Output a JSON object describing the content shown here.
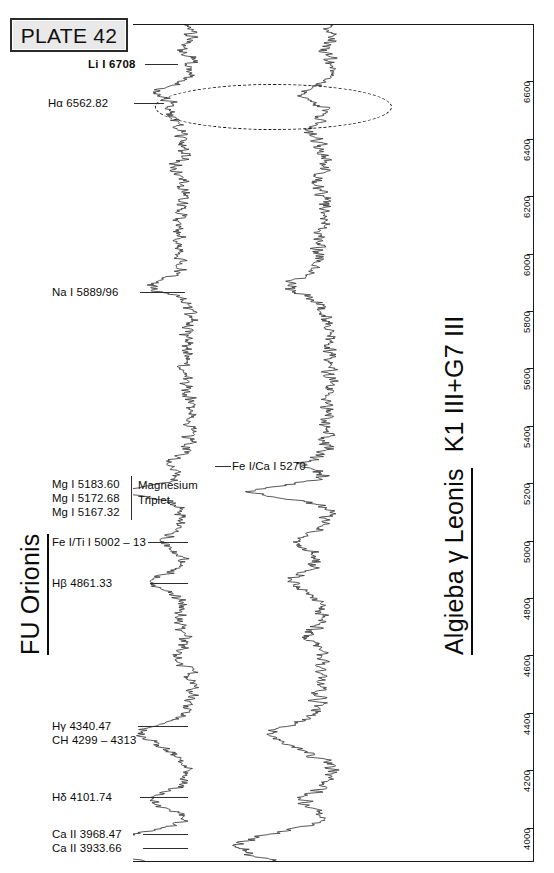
{
  "plate": {
    "label": "PLATE 42"
  },
  "stars": {
    "left": {
      "name": "FU Orionis"
    },
    "right": {
      "name": "Algieba  γ Leonis",
      "spectral_type": "K1 III+G7 III"
    }
  },
  "annotations": {
    "halpha_circle": {
      "name": "halpha-emission-ellipse",
      "style": "dashed"
    }
  },
  "line_labels": [
    {
      "id": "li-6708",
      "text": "Li I  6708",
      "y": 64,
      "leader": true,
      "bold": true
    },
    {
      "id": "halpha",
      "text": "Hα 6562.82",
      "y": 103,
      "leader": true,
      "bold": false
    },
    {
      "id": "na-5889",
      "text": "Na I 5889/96",
      "y": 292,
      "leader": true,
      "bold": false
    },
    {
      "id": "fe-ca-5270",
      "text": "Fe I/Ca I  5270",
      "y": 466,
      "leader": true,
      "bold": false
    },
    {
      "id": "mg-5183",
      "text": "Mg I 5183.60",
      "y": 484,
      "leader": false,
      "bold": false
    },
    {
      "id": "mg-5172",
      "text": "Mg I 5172.68",
      "y": 498,
      "leader": false,
      "bold": false
    },
    {
      "id": "mg-5167",
      "text": "Mg I 5167.32",
      "y": 512,
      "leader": false,
      "bold": false
    },
    {
      "id": "mg-group-1",
      "text": "Magnesium",
      "y": 485,
      "leader": false,
      "bold": false
    },
    {
      "id": "mg-group-2",
      "text": "Triplet",
      "y": 500,
      "leader": false,
      "bold": false
    },
    {
      "id": "fe-ti-5002",
      "text": "Fe I/Ti I 5002 – 13",
      "y": 542,
      "leader": true,
      "bold": false
    },
    {
      "id": "hbeta",
      "text": "Hβ 4861.33",
      "y": 583,
      "leader": true,
      "bold": false
    },
    {
      "id": "hgamma",
      "text": "Hγ 4340.47",
      "y": 726,
      "leader": true,
      "bold": false
    },
    {
      "id": "ch-4299",
      "text": "CH 4299 – 4313",
      "y": 740,
      "leader": false,
      "bold": false
    },
    {
      "id": "hdelta",
      "text": "Hδ 4101.74",
      "y": 797,
      "leader": true,
      "bold": false
    },
    {
      "id": "ca2-3968",
      "text": "Ca II 3968.47",
      "y": 834,
      "leader": true,
      "bold": false
    },
    {
      "id": "ca2-3933",
      "text": "Ca II 3933.66",
      "y": 848,
      "leader": true,
      "bold": false
    }
  ],
  "chart_data": {
    "type": "line",
    "title": "PLATE 42",
    "orientation": "vertical",
    "xlabel": "Relative flux",
    "ylabel": "Wavelength (Å)",
    "ylim": [
      3880,
      6800
    ],
    "grid": false,
    "axis_side": "right",
    "tick_labels": [
      "6600",
      "6400",
      "6200",
      "6000",
      "5800",
      "5600",
      "5400",
      "5200",
      "5000",
      "4800",
      "4600",
      "4400",
      "4200",
      "4000"
    ],
    "tick_values": [
      6600,
      6400,
      6200,
      6000,
      5800,
      5600,
      5400,
      5200,
      5000,
      4800,
      4600,
      4400,
      4200,
      4000
    ],
    "series": [
      {
        "name": "FU Orionis",
        "type": "F-type supergiant spectrum",
        "trace_center_x": 185
      },
      {
        "name": "Algieba γ Leonis",
        "type": "K1 III+G7 III spectrum",
        "trace_center_x": 325
      }
    ],
    "marked_lines": [
      {
        "label": "Li I  6708",
        "wavelength": 6708
      },
      {
        "label": "Hα 6562.82",
        "wavelength": 6562.82
      },
      {
        "label": "Na I 5889/96",
        "wavelength": 5889
      },
      {
        "label": "Fe I/Ca I  5270",
        "wavelength": 5270
      },
      {
        "label": "Mg I 5183.60",
        "wavelength": 5183.6
      },
      {
        "label": "Mg I 5172.68",
        "wavelength": 5172.68
      },
      {
        "label": "Mg I 5167.32",
        "wavelength": 5167.32
      },
      {
        "label": "Fe I/Ti I 5002 – 13",
        "wavelength": 5002
      },
      {
        "label": "Hβ 4861.33",
        "wavelength": 4861.33
      },
      {
        "label": "Hγ 4340.47",
        "wavelength": 4340.47
      },
      {
        "label": "CH 4299 – 4313",
        "wavelength": 4299
      },
      {
        "label": "Hδ 4101.74",
        "wavelength": 4101.74
      },
      {
        "label": "Ca II 3968.47",
        "wavelength": 3968.47
      },
      {
        "label": "Ca II 3933.66",
        "wavelength": 3933.66
      }
    ]
  }
}
